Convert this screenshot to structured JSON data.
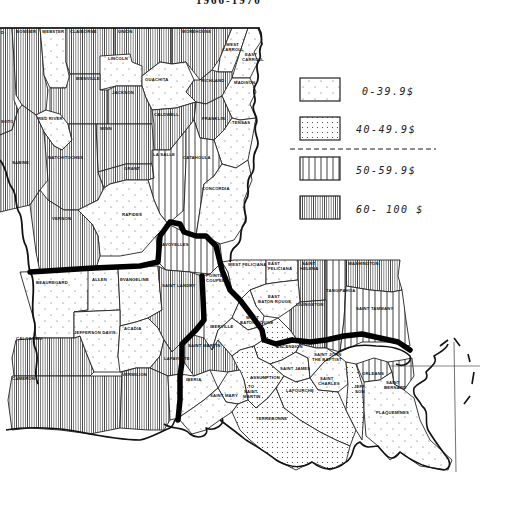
{
  "map": {
    "title_fragment": "1966-1970",
    "subject": "Louisiana parishes",
    "legend": {
      "items": [
        {
          "range": "0-39.9%",
          "pattern": "sparse-dots",
          "label": "0-39.9$"
        },
        {
          "range": "40-49.9%",
          "pattern": "dense-dots",
          "label": "40-49.9$"
        },
        {
          "range": "50-59.9%",
          "pattern": "wide-vertical-lines",
          "label": "50-59.9$"
        },
        {
          "range": "60-100%",
          "pattern": "dense-vertical-lines",
          "label": "60- 100 $"
        }
      ],
      "divider": "dashed line separating below-50% from 50%+ classes"
    },
    "colors": {
      "ink": "#111111",
      "paper": "#ffffff"
    },
    "parishes": [
      {
        "name": "BOSSIER",
        "class": "60-100%"
      },
      {
        "name": "WEBSTER",
        "class": "0-39.9%"
      },
      {
        "name": "CLAIBORNE",
        "class": "60-100%"
      },
      {
        "name": "UNION",
        "class": "60-100%"
      },
      {
        "name": "MOREHOUSE",
        "class": "60-100%"
      },
      {
        "name": "WEST CARROLL",
        "class": "0-39.9%"
      },
      {
        "name": "EAST CARROLL",
        "class": "0-39.9%"
      },
      {
        "name": "LINCOLN",
        "class": "0-39.9%"
      },
      {
        "name": "OUACHITA",
        "class": "0-39.9%"
      },
      {
        "name": "BIENVILLE",
        "class": "60-100%"
      },
      {
        "name": "JACKSON",
        "class": "60-100%"
      },
      {
        "name": "RICHLAND",
        "class": "60-100%"
      },
      {
        "name": "MADISON",
        "class": "0-39.9%"
      },
      {
        "name": "DE SOTO",
        "class": "60-100%"
      },
      {
        "name": "RED RIVER",
        "class": "0-39.9%"
      },
      {
        "name": "CALDWELL",
        "class": "60-100%"
      },
      {
        "name": "FRANKLIN",
        "class": "60-100%"
      },
      {
        "name": "TENSAS",
        "class": "0-39.9%"
      },
      {
        "name": "WINN",
        "class": "60-100%"
      },
      {
        "name": "SABINE",
        "class": "60-100%"
      },
      {
        "name": "NATCHITOCHES",
        "class": "60-100%"
      },
      {
        "name": "GRANT",
        "class": "60-100%"
      },
      {
        "name": "LA SALLE",
        "class": "50-59.9%"
      },
      {
        "name": "CATAHOULA",
        "class": "50-59.9%"
      },
      {
        "name": "CONCORDIA",
        "class": "0-39.9%"
      },
      {
        "name": "RAPIDES",
        "class": "0-39.9%"
      },
      {
        "name": "VERNON",
        "class": "60-100%"
      },
      {
        "name": "AVOYELLES",
        "class": "50-59.9%"
      },
      {
        "name": "BEAUREGARD",
        "class": "0-39.9%"
      },
      {
        "name": "ALLEN",
        "class": "0-39.9%"
      },
      {
        "name": "EVANGELINE",
        "class": "0-39.9%"
      },
      {
        "name": "SAINT LANDRY",
        "class": "60-100%"
      },
      {
        "name": "POINTE COUPEE",
        "class": "0-39.9%"
      },
      {
        "name": "WEST FELICIANA",
        "class": "0-39.9%"
      },
      {
        "name": "EAST FELICIANA",
        "class": "0-39.9%"
      },
      {
        "name": "SAINT HELENA",
        "class": "60-100%"
      },
      {
        "name": "WASHINGTON",
        "class": "60-100%"
      },
      {
        "name": "TANGIPAHOA",
        "class": "50-59.9%"
      },
      {
        "name": "SAINT TAMMANY",
        "class": "50-59.9%"
      },
      {
        "name": "EAST BATON ROUGE",
        "class": "0-39.9%"
      },
      {
        "name": "LIVINGSTON",
        "class": "60-100%"
      },
      {
        "name": "WEST BATON ROUGE",
        "class": "0-39.9%"
      },
      {
        "name": "IBERVILLE",
        "class": "0-39.9%"
      },
      {
        "name": "CALCASIEU",
        "class": "60-100%"
      },
      {
        "name": "JEFFERSON DAVIS",
        "class": "0-39.9%"
      },
      {
        "name": "ACADIA",
        "class": "0-39.9%"
      },
      {
        "name": "LAFAYETTE",
        "class": "60-100%"
      },
      {
        "name": "SAINT MARTIN",
        "class": "60-100%"
      },
      {
        "name": "CAMERON",
        "class": "60-100%"
      },
      {
        "name": "VERMILION",
        "class": "60-100%"
      },
      {
        "name": "IBERIA",
        "class": "0-39.9%"
      },
      {
        "name": "ASCENSION",
        "class": "40-49.9%"
      },
      {
        "name": "SAINT JAMES",
        "class": "0-39.9%"
      },
      {
        "name": "SAINT JOHN THE BAPTIST",
        "class": "0-39.9%"
      },
      {
        "name": "ASSUMPTION",
        "class": "40-49.9%"
      },
      {
        "name": "SAINT MARY",
        "class": "0-39.9%"
      },
      {
        "name": "TO SAINT MARTIN",
        "class": "0-39.9%"
      },
      {
        "name": "LAFOURCHE",
        "class": "40-49.9%"
      },
      {
        "name": "SAINT CHARLES",
        "class": "0-39.9%"
      },
      {
        "name": "ORLEANS",
        "class": "50-59.9%"
      },
      {
        "name": "SAINT BERNARD",
        "class": "50-59.9%"
      },
      {
        "name": "JEFFERSON",
        "class": "40-49.9%"
      },
      {
        "name": "PLAQUEMINES",
        "class": "0-39.9%"
      },
      {
        "name": "TERREBONNE",
        "class": "40-49.9%"
      }
    ],
    "labels": {
      "bossier": "BOSSIER",
      "webster": "WEBSTER",
      "claiborne": "CLAIBORNE",
      "union": "UNION",
      "morehouse": "MOREHOUSE",
      "west_carroll_1": "WEST",
      "west_carroll_2": "CARROLL",
      "east_carroll_1": "EAST",
      "east_carroll_2": "CARROLL",
      "lincoln": "LINCOLN",
      "ouachita": "OUACHITA",
      "bienville": "BIENVILLE",
      "jackson": "JACKSON",
      "richland": "RICHLAND",
      "madison": "MADISON",
      "desoto": "SOTO",
      "red_river": "RED RIVER",
      "caldwell": "CALDWELL",
      "franklin": "FRANKLIN",
      "tensas": "TENSAS",
      "winn": "WINN",
      "sabine": "SABINE",
      "natchitoches": "NATCHITOCHES",
      "grant": "GRANT",
      "lasalle": "LA SALLE",
      "catahoula": "CATAHOULA",
      "concordia": "CONCORDIA",
      "rapides": "RAPIDES",
      "vernon": "VERNON",
      "avoyelles": "AVOYELLES",
      "beauregard": "BEAUREGARD",
      "allen": "ALLEN",
      "evangeline": "EVANGELINE",
      "saint_landry": "SAINT LANDRY",
      "pointe_coupee_1": "POINTE",
      "pointe_coupee_2": "COUPEE",
      "west_feliciana": "WEST FELICIANA",
      "east_feliciana_1": "EAST",
      "east_feliciana_2": "FELICIANA",
      "saint_helena_1": "SAINT",
      "saint_helena_2": "HELENA",
      "washington": "WASHINGTON",
      "tangipahoa": "TANGIPAHOA",
      "saint_tammany": "SAINT TAMMANY",
      "ebr_1": "EAST",
      "ebr_2": "BATON ROUGE",
      "livingston": "LIVINGSTON",
      "wbr_1": "WEST",
      "wbr_2": "BATON ROUGE",
      "iberville": "IBERVILLE",
      "calcasieu": "CALCASIEU",
      "jefferson_davis": "JEFFERSON DAVIS",
      "acadia": "ACADIA",
      "lafayette": "LAFAYETTE",
      "saint_martin": "SAINT MARTIN",
      "cameron": "CAMERON",
      "vermilion": "VERMILION",
      "iberia": "IBERIA",
      "ascension": "ASCENSION",
      "saint_james": "SAINT JAMES",
      "sjb_1": "SAINT JOHN",
      "sjb_2": "THE BAPTIST",
      "assumption": "ASSUMPTION",
      "saint_mary": "SAINT MARY",
      "to_sm_1": "TO",
      "to_sm_2": "SAINT",
      "to_sm_3": "MARTIN",
      "lafourche": "LAFOURCHE",
      "saint_charles_1": "SAINT",
      "saint_charles_2": "CHARLES",
      "orleans": "ORLEANS",
      "saint_bernard_1": "SAINT",
      "saint_bernard_2": "BERNARD",
      "jefferson": "JEFF-",
      "jefferson_2": "SON",
      "plaquemines": "PLAQUEMINES",
      "terrebonne": "TERREBONNE"
    }
  }
}
